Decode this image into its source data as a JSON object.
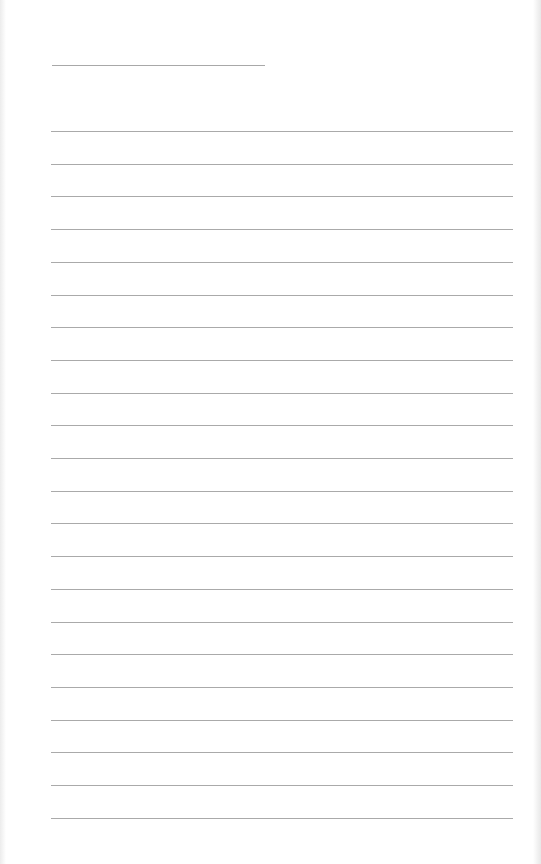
{
  "page": {
    "type": "lined-paper",
    "background_color": "#ffffff",
    "line_color": "#aaaaaa",
    "header_line": {
      "x": 52,
      "y": 65,
      "width": 213
    },
    "ruled_lines": {
      "count": 22,
      "first_y": 131,
      "spacing": 32.7,
      "x": 51,
      "width": 462
    }
  }
}
